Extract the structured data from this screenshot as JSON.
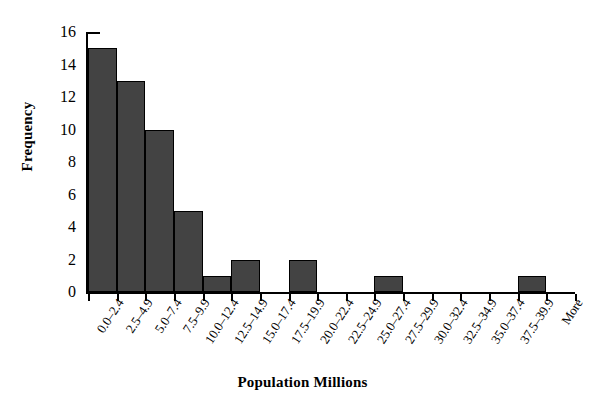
{
  "chart_data": {
    "type": "bar",
    "title": "",
    "xlabel": "Population Millions",
    "ylabel": "Frequency",
    "categories": [
      "0.0–2.4",
      "2.5–4.9",
      "5.0–7.4",
      "7.5–9.9",
      "10.0–12.4",
      "12.5–14.9",
      "15.0–17.4",
      "17.5–19.9",
      "20.0–22.4",
      "22.5–24.9",
      "25.0–27.4",
      "27.5–29.9",
      "30.0–32.4",
      "32.5–34.9",
      "35.0–37.4",
      "37.5–39.9",
      "More"
    ],
    "values": [
      15,
      13,
      10,
      5,
      1,
      2,
      0,
      2,
      0,
      0,
      1,
      0,
      0,
      0,
      0,
      1,
      0
    ],
    "ylim": [
      0,
      16
    ],
    "yticks": [
      0,
      2,
      4,
      6,
      8,
      10,
      12,
      14,
      16
    ],
    "ytick_labels": [
      "0",
      "2",
      "4",
      "6",
      "8",
      "10",
      "12",
      "14",
      "16"
    ],
    "grid": false,
    "legend": false,
    "bar_color": "#434343",
    "bar_edge_color": "#000000",
    "axis_color": "#000000",
    "background_color": "#ffffff"
  }
}
